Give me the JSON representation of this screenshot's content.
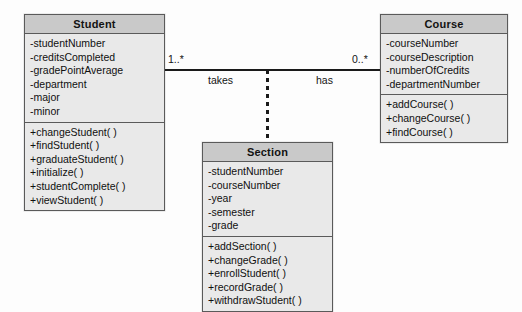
{
  "diagram": {
    "type": "uml-class-diagram",
    "background_color": "#fdfdfd",
    "header_fill": "#c9c9c9",
    "body_fill": "#e9e9e9",
    "line_color": "#1a1a1a"
  },
  "classes": [
    {
      "id": "student",
      "name": "Student",
      "attributes": [
        "-studentNumber",
        "-creditsCompleted",
        "-gradePointAverage",
        "-department",
        "-major",
        "-minor"
      ],
      "operations": [
        "+changeStudent( )",
        "+findStudent( )",
        "+graduateStudent( )",
        "+initialize( )",
        "+studentComplete( )",
        "+viewStudent( )"
      ]
    },
    {
      "id": "course",
      "name": "Course",
      "attributes": [
        "-courseNumber",
        "-courseDescription",
        "-numberOfCredits",
        "-departmentNumber"
      ],
      "operations": [
        "+addCourse( )",
        "+changeCourse( )",
        "+findCourse( )"
      ]
    },
    {
      "id": "section",
      "name": "Section",
      "attributes": [
        "-studentNumber",
        "-courseNumber",
        "-year",
        "-semester",
        "-grade"
      ],
      "operations": [
        "+addSection( )",
        "+changeGrade( )",
        "+enrollStudent( )",
        "+recordGrade( )",
        "+withdrawStudent( )"
      ]
    }
  ],
  "association": {
    "multiplicity_student_end": "1..*",
    "multiplicity_course_end": "0..*",
    "role_near_student": "takes",
    "role_near_course": "has"
  }
}
